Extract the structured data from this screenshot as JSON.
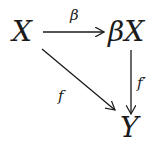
{
  "diagram": {
    "type": "commutative-diagram",
    "nodes": {
      "source": "X",
      "compactification": "βX",
      "target": "Y"
    },
    "arrows": {
      "top": {
        "from": "X",
        "to": "βX",
        "label": "β"
      },
      "right": {
        "from": "βX",
        "to": "Y",
        "label": "f′"
      },
      "diagonal": {
        "from": "X",
        "to": "Y",
        "label": "f"
      }
    },
    "colors": {
      "ink": "#1a1a1a",
      "background": "#ffffff"
    }
  }
}
